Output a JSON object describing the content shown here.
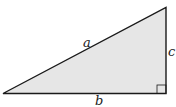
{
  "diagram": {
    "type": "right-triangle",
    "fill_color": "#e6e6e6",
    "stroke_color": "#1a1a1a",
    "labels": {
      "hypotenuse": "a",
      "base": "b",
      "height": "c"
    },
    "right_angle_marker": true
  }
}
